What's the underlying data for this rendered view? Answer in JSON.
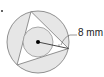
{
  "diagram": {
    "type": "geometry",
    "radius_label": "8 mm",
    "colors": {
      "shade": "#e6e6e6",
      "stroke": "#777777",
      "center": "#000000",
      "triangle_fill": "#ffffff"
    }
  }
}
